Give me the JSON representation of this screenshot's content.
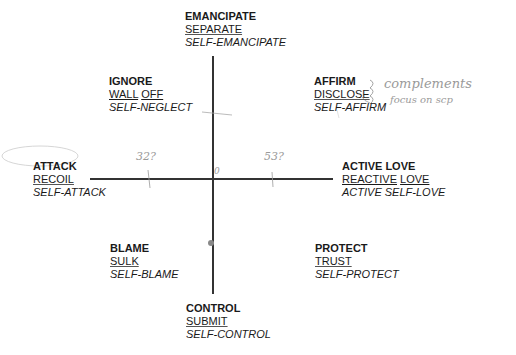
{
  "diagram": {
    "type": "two-axis quadrant model",
    "nodes": {
      "top": {
        "title": "EMANCIPATE",
        "middle": [
          "SEPARATE"
        ],
        "self": "SELF-EMANCIPATE"
      },
      "upper_left": {
        "title": "IGNORE",
        "middle": [
          "WALL",
          "OFF"
        ],
        "self": "SELF-NEGLECT"
      },
      "upper_right": {
        "title": "AFFIRM",
        "middle": [
          "DISCLOSE"
        ],
        "self": "SELF-AFFIRM"
      },
      "left": {
        "title": "ATTACK",
        "middle": [
          "RECOIL"
        ],
        "self": "SELF-ATTACK"
      },
      "right": {
        "title": "ACTIVE LOVE",
        "middle": [
          "REACTIVE",
          "LOVE"
        ],
        "self": "ACTIVE SELF-LOVE"
      },
      "lower_left": {
        "title": "BLAME",
        "middle": [
          "SULK"
        ],
        "self": "SELF-BLAME"
      },
      "lower_right": {
        "title": "PROTECT",
        "middle": [
          "TRUST"
        ],
        "self": "SELF-PROTECT"
      },
      "bottom": {
        "title": "CONTROL",
        "middle": [
          "SUBMIT"
        ],
        "self": "SELF-CONTROL"
      }
    },
    "annotations": {
      "brace_note_1": "complements",
      "brace_note_2": "focus on scp",
      "left_mark": "32?",
      "right_mark": "53?",
      "origin_mark": "0"
    },
    "colors": {
      "text": "#1a1a1a",
      "axis": "#333333",
      "handwriting": "#9a9a9a",
      "dot": "#888888"
    }
  }
}
